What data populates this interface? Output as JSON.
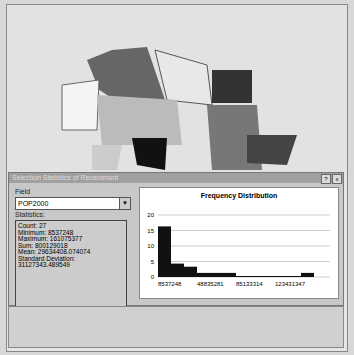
{
  "dialog": {
    "title": "Selection Statistics of Recentmont",
    "help": "?",
    "close": "x"
  },
  "field": {
    "label": "Field",
    "value": "POP2000"
  },
  "statistics": {
    "label": "Statistics:",
    "lines": [
      "Count:    27",
      "Minimum: 8537248",
      "Maximum: 161075377",
      "Sum:      800129018",
      "Mean:     29634408.074074",
      "Standard Deviation: 31127343.489549"
    ]
  },
  "chart_data": {
    "type": "bar",
    "title": "Frequency Distribution",
    "categories": [
      "8537248",
      "",
      "",
      "48835281",
      "",
      "",
      "85133314",
      "",
      "",
      "123431347",
      "",
      ""
    ],
    "values": [
      16,
      4,
      3,
      1,
      1,
      1,
      0,
      0,
      0,
      0,
      0,
      1
    ],
    "xlabel": "",
    "ylabel": "",
    "ylim": [
      0,
      20
    ],
    "yticks": [
      0,
      5,
      10,
      15,
      20
    ],
    "xtick_labels": [
      "8537248",
      "48835281",
      "85133314",
      "123431347"
    ]
  }
}
